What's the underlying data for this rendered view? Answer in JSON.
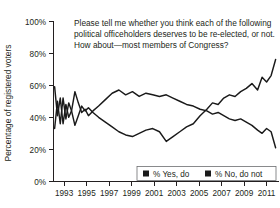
{
  "chart_data": {
    "type": "line",
    "title": "Please tell me whether you think each of the following political officeholders deserves to be re-elected, or not. How about—most members of Congress?",
    "title_lines": [
      "Please tell me whether you think each of the following",
      "political officeholders deserves to be re-elected, or not.",
      "How about—most members of Congress?"
    ],
    "xlabel": "",
    "ylabel": "Percentage of registered voters",
    "ylim": [
      0,
      100
    ],
    "xlim": [
      1992,
      2012
    ],
    "grid": false,
    "legend_position": "bottom-right",
    "yticks": [
      "0%",
      "20%",
      "40%",
      "60%",
      "80%",
      "100%"
    ],
    "ytick_values": [
      0,
      20,
      40,
      60,
      80,
      100
    ],
    "xticks": [
      "1993",
      "1995",
      "1997",
      "1999",
      "2001",
      "2003",
      "2005",
      "2007",
      "2009",
      "2011"
    ],
    "xtick_values": [
      1993,
      1995,
      1997,
      1999,
      2001,
      2003,
      2005,
      2007,
      2009,
      2011
    ],
    "series": [
      {
        "name": "% Yes, do",
        "color": "#1a1a1a",
        "x": [
          1992.1,
          1992.35,
          1992.6,
          1992.85,
          1993.1,
          1993.35,
          1993.6,
          1993.9,
          1994.2,
          1994.5,
          1994.8,
          1995.1,
          1995.5,
          1996.0,
          1996.6,
          1997.2,
          1997.8,
          1998.4,
          1999.0,
          1999.6,
          2000.2,
          2000.8,
          2001.4,
          2002.0,
          2002.6,
          2003.2,
          2003.8,
          2004.4,
          2005.0,
          2005.6,
          2006.1,
          2006.6,
          2007.1,
          2007.6,
          2008.1,
          2008.6,
          2009.1,
          2009.6,
          2010.1,
          2010.5,
          2010.9,
          2011.3,
          2011.7
        ],
        "y": [
          59,
          41,
          52,
          36,
          48,
          40,
          44,
          56,
          49,
          43,
          45,
          41,
          44,
          47,
          51,
          55,
          57,
          54,
          56,
          53,
          55,
          54,
          53,
          54,
          52,
          50,
          48,
          47,
          45,
          44,
          42,
          43,
          41,
          39,
          38,
          39,
          37,
          35,
          32,
          30,
          33,
          31,
          21
        ]
      },
      {
        "name": "% No, do not",
        "color": "#1a1a1a",
        "x": [
          1992.1,
          1992.35,
          1992.6,
          1992.85,
          1993.1,
          1993.35,
          1993.6,
          1993.9,
          1994.2,
          1994.5,
          1994.8,
          1995.1,
          1995.5,
          1996.0,
          1996.6,
          1997.2,
          1997.8,
          1998.4,
          1999.0,
          1999.6,
          2000.2,
          2000.8,
          2001.4,
          2002.0,
          2002.6,
          2003.2,
          2003.8,
          2004.4,
          2005.0,
          2005.6,
          2006.1,
          2006.6,
          2007.1,
          2007.6,
          2008.1,
          2008.6,
          2009.1,
          2009.6,
          2010.1,
          2010.5,
          2010.9,
          2011.3,
          2011.7
        ],
        "y": [
          33,
          50,
          36,
          52,
          39,
          49,
          44,
          35,
          41,
          47,
          44,
          46,
          43,
          40,
          37,
          34,
          31,
          29,
          28,
          30,
          32,
          33,
          31,
          25,
          28,
          31,
          34,
          36,
          41,
          45,
          49,
          48,
          52,
          54,
          53,
          56,
          58,
          61,
          57,
          65,
          62,
          66,
          76
        ]
      }
    ],
    "legend": [
      {
        "label": "% Yes, do",
        "color": "#1a1a1a"
      },
      {
        "label": "% No, do not",
        "color": "#1a1a1a"
      }
    ]
  }
}
